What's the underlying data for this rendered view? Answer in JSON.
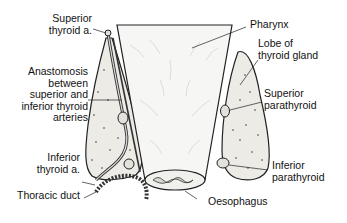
{
  "diagram": {
    "type": "anatomical illustration",
    "labels": {
      "superior_thyroid_artery": "Superior\nthyroid a.",
      "anastomosis": "Anastomosis\nbetween\nsuperior and\ninferior thyroid\narteries",
      "inferior_thyroid_artery": "Inferior\nthyroid a.",
      "thoracic_duct": "Thoracic duct",
      "pharynx": "Pharynx",
      "lobe_of_thyroid": "Lobe of\nthyroid gland",
      "superior_parathyroid": "Superior\nparathyroid",
      "inferior_parathyroid": "Inferior\nparathyroid",
      "oesophagus": "Oesophagus"
    },
    "colors": {
      "line": "#222222",
      "gland_fill": "#ecebe6",
      "tube_fill": "#f6f6f4",
      "background": "#ffffff"
    }
  }
}
